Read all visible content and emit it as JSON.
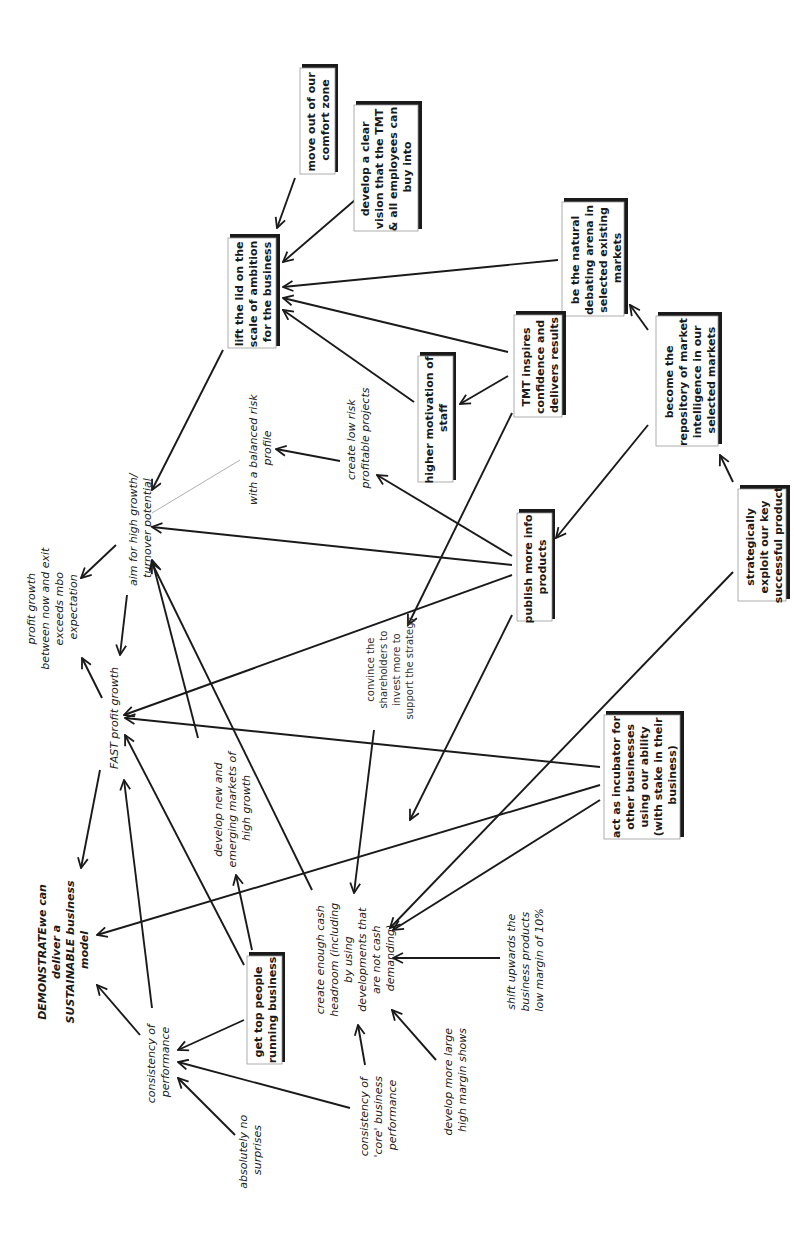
{
  "diagram": {
    "type": "cognitive-map",
    "orientation": "rotated-90-ccw",
    "nodes": {
      "move_out": {
        "style": "box",
        "lines": [
          "move out of our",
          "comfort zone"
        ]
      },
      "develop_vision": {
        "style": "box",
        "lines": [
          "develop a clear",
          "vision that the TMT",
          "& all employees can",
          "buy into"
        ]
      },
      "lift_lid": {
        "style": "box",
        "lines": [
          "lift the lid on the",
          "scale of ambition",
          "for the business"
        ]
      },
      "natural_debating": {
        "style": "box",
        "lines": [
          "be the natural",
          "debating arena in",
          "selected existing",
          "markets"
        ]
      },
      "tmt_inspires": {
        "style": "box",
        "lines": [
          "TMT inspires",
          "confidence and",
          "delivers results"
        ]
      },
      "higher_motivation": {
        "style": "box",
        "lines": [
          "higher motivation of",
          "staff"
        ]
      },
      "repository": {
        "style": "box",
        "lines": [
          "become the",
          "repository of market",
          "intelligence in our",
          "selected markets"
        ]
      },
      "balanced_risk": {
        "style": "italic",
        "lines": [
          "with a balanced risk",
          "profile"
        ]
      },
      "low_risk": {
        "style": "italic",
        "lines": [
          "create low risk",
          "profitable projects"
        ]
      },
      "publish_info": {
        "style": "box",
        "lines": [
          "publish more info",
          "products"
        ]
      },
      "strategically_exploit": {
        "style": "box",
        "lines": [
          "strategically",
          "exploit our key",
          "successful product"
        ]
      },
      "aim_high_growth": {
        "style": "italic",
        "lines": [
          "aim for high growth/",
          "turnover potential"
        ]
      },
      "profit_growth_exit": {
        "style": "italic",
        "lines": [
          "profit growth",
          "between now and exit",
          "exceeds mbo",
          "expectation"
        ]
      },
      "fast_profit": {
        "style": "italic",
        "lines": [
          "FAST profit growth"
        ]
      },
      "convince_shareholders": {
        "style": "plain",
        "lines": [
          "convince the",
          "shareholders to",
          "invest more to",
          "support the strategy"
        ]
      },
      "incubator": {
        "style": "box",
        "lines": [
          "act as incubator for",
          "other businesses",
          "using our ability",
          "(with stake in their",
          "business)"
        ]
      },
      "develop_new_markets": {
        "style": "italic",
        "lines": [
          "develop new and",
          "emerging markets of",
          "high growth"
        ]
      },
      "demonstrate": {
        "style": "bold-italic",
        "lines": [
          "DEMONSTRATEwe can",
          "deliver a",
          "SUSTAINABLE business",
          "model"
        ]
      },
      "consistency_perf": {
        "style": "italic",
        "lines": [
          "consistency of",
          "performance"
        ]
      },
      "get_top_people": {
        "style": "box",
        "lines": [
          "get top people",
          "running business"
        ]
      },
      "cash_headroom": {
        "style": "italic",
        "lines": [
          "create enough cash",
          "headroom (including",
          "by using",
          "developments that",
          "are not cash",
          "demanding)"
        ]
      },
      "shift_upwards": {
        "style": "italic",
        "lines": [
          "shift upwards the",
          "business products",
          "low margin of 10%"
        ]
      },
      "absolutely_no": {
        "style": "italic",
        "lines": [
          "absolutely no",
          "surprises"
        ]
      },
      "consistency_core": {
        "style": "italic",
        "lines": [
          "consistency of",
          "'core' business",
          "performance"
        ]
      },
      "large_margin": {
        "style": "italic",
        "lines": [
          "develop more large",
          "high margin shows"
        ]
      }
    },
    "edges": [
      {
        "from": "move_out",
        "to": "lift_lid"
      },
      {
        "from": "develop_vision",
        "to": "lift_lid"
      },
      {
        "from": "natural_debating",
        "to": "lift_lid"
      },
      {
        "from": "tmt_inspires",
        "to": "lift_lid"
      },
      {
        "from": "higher_motivation",
        "to": "lift_lid"
      },
      {
        "from": "tmt_inspires",
        "to": "higher_motivation"
      },
      {
        "from": "repository",
        "to": "natural_debating"
      },
      {
        "from": "strategically_exploit",
        "to": "repository"
      },
      {
        "from": "repository",
        "to": "publish_info"
      },
      {
        "from": "lift_lid",
        "to": "aim_high_growth"
      },
      {
        "from": "aim_high_growth",
        "to": "balanced_risk",
        "style": "thin-line"
      },
      {
        "from": "low_risk",
        "to": "balanced_risk"
      },
      {
        "from": "publish_info",
        "to": "low_risk"
      },
      {
        "from": "publish_info",
        "to": "aim_high_growth"
      },
      {
        "from": "publish_info",
        "to": "fast_profit"
      },
      {
        "from": "publish_info",
        "to": "cash_headroom"
      },
      {
        "from": "tmt_inspires",
        "to": "convince_shareholders"
      },
      {
        "from": "convince_shareholders",
        "to": "cash_headroom"
      },
      {
        "from": "strategically_exploit",
        "to": "cash_headroom"
      },
      {
        "from": "incubator",
        "to": "fast_profit"
      },
      {
        "from": "incubator",
        "to": "demonstrate"
      },
      {
        "from": "incubator",
        "to": "cash_headroom"
      },
      {
        "from": "aim_high_growth",
        "to": "profit_growth_exit"
      },
      {
        "from": "aim_high_growth",
        "to": "fast_profit"
      },
      {
        "from": "fast_profit",
        "to": "profit_growth_exit"
      },
      {
        "from": "fast_profit",
        "to": "demonstrate"
      },
      {
        "from": "develop_new_markets",
        "to": "aim_high_growth"
      },
      {
        "from": "cash_headroom",
        "to": "aim_high_growth"
      },
      {
        "from": "get_top_people",
        "to": "fast_profit"
      },
      {
        "from": "get_top_people",
        "to": "develop_new_markets"
      },
      {
        "from": "get_top_people",
        "to": "consistency_perf"
      },
      {
        "from": "consistency_perf",
        "to": "fast_profit"
      },
      {
        "from": "consistency_perf",
        "to": "demonstrate"
      },
      {
        "from": "absolutely_no",
        "to": "consistency_perf"
      },
      {
        "from": "consistency_core",
        "to": "consistency_perf"
      },
      {
        "from": "consistency_core",
        "to": "cash_headroom"
      },
      {
        "from": "shift_upwards",
        "to": "cash_headroom"
      },
      {
        "from": "large_margin",
        "to": "cash_headroom"
      }
    ],
    "colors": {
      "ink": "#1a1a1a",
      "box_border": "#999999",
      "thin_link": "#9a9a9a",
      "background": "#ffffff"
    }
  }
}
